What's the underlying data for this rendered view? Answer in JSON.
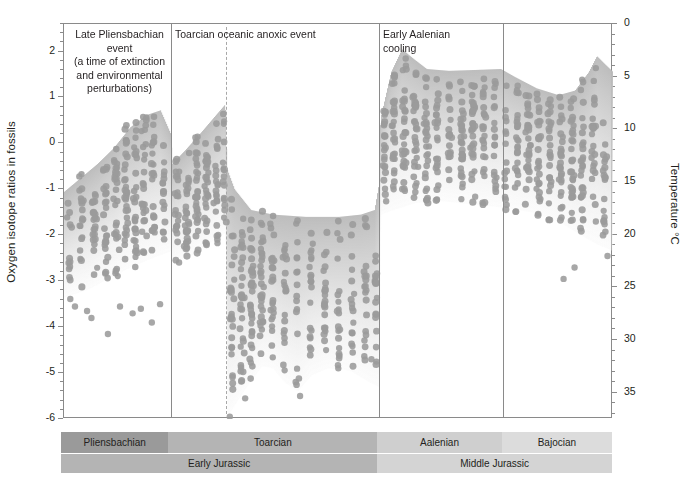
{
  "chart_data": {
    "type": "scatter",
    "title": "",
    "ylabel": "Oxygen isotope ratios in fossils",
    "ylabel_right": "Temperature °C",
    "xlabel": "",
    "ylim": [
      -6,
      2.6
    ],
    "yticks": [
      2,
      1,
      0,
      -1,
      -2,
      -3,
      -4,
      -5,
      -6
    ],
    "ytick_labels": [
      "2",
      "1",
      "0",
      "-1",
      "-2",
      "-3",
      "-4",
      "-5",
      "-6"
    ],
    "yminor_step": 0.2,
    "y2lim": [
      0,
      37.5
    ],
    "y2ticks": [
      0,
      5,
      10,
      15,
      20,
      25,
      30,
      35
    ],
    "y2tick_labels": [
      "0",
      "5",
      "10",
      "15",
      "20",
      "25",
      "30",
      "35"
    ],
    "y2minor_step": 1,
    "grid": false,
    "legend": "none",
    "point_color": "#a3a3a3",
    "envelope_color": "#c9c9c9",
    "xlim": [
      0,
      100
    ],
    "annotations": [
      {
        "id": "late-pliensbachian-event",
        "text": "Late Pliensbachian event (a time of extinction and environmental perturbations)",
        "lines": [
          "Late Pliensbachian event",
          "(a time of extinction",
          "and environmental",
          "perturbations)"
        ],
        "x_pct": 9.8,
        "align": "centered"
      },
      {
        "id": "toarcian-oceanic-anoxic-event",
        "text": "Toarcian oceanic anoxic event",
        "lines": [
          "Toarcian oceanic anoxic event"
        ],
        "x_pct": 20.0,
        "align": "left"
      },
      {
        "id": "early-aalenian-cooling",
        "text": "Early Aalenian cooling",
        "lines": [
          "Early Aalenian",
          "cooling"
        ],
        "x_pct": 58.0,
        "align": "left"
      }
    ],
    "dividers": [
      {
        "id": "divider-pliensbachian-toarcian",
        "x_pct": 19.5,
        "style": "solid"
      },
      {
        "id": "divider-oae-peak",
        "x_pct": 29.5,
        "style": "dashed"
      },
      {
        "id": "divider-toarcian-aalenian",
        "x_pct": 57.4,
        "style": "solid"
      },
      {
        "id": "divider-aalenian-bajocian",
        "x_pct": 80.0,
        "style": "solid"
      }
    ],
    "envelope_upper": [
      {
        "x": 0,
        "y": -1.05
      },
      {
        "x": 3,
        "y": -0.75
      },
      {
        "x": 6,
        "y": -0.45
      },
      {
        "x": 9,
        "y": -0.1
      },
      {
        "x": 12,
        "y": 0.35
      },
      {
        "x": 15,
        "y": 0.62
      },
      {
        "x": 17.5,
        "y": 0.72
      },
      {
        "x": 19.4,
        "y": 0.2
      },
      {
        "x": 19.6,
        "y": -0.45
      },
      {
        "x": 22,
        "y": -0.15
      },
      {
        "x": 25,
        "y": 0.25
      },
      {
        "x": 27.5,
        "y": 0.6
      },
      {
        "x": 29.3,
        "y": 0.85
      },
      {
        "x": 29.6,
        "y": -0.55
      },
      {
        "x": 31,
        "y": -1.0
      },
      {
        "x": 34,
        "y": -1.45
      },
      {
        "x": 38,
        "y": -1.55
      },
      {
        "x": 44,
        "y": -1.6
      },
      {
        "x": 50,
        "y": -1.6
      },
      {
        "x": 54,
        "y": -1.55
      },
      {
        "x": 56.5,
        "y": -1.45
      },
      {
        "x": 57.2,
        "y": -0.95
      },
      {
        "x": 57.6,
        "y": 0.55
      },
      {
        "x": 59.5,
        "y": 1.55
      },
      {
        "x": 61.5,
        "y": 2.05
      },
      {
        "x": 63.5,
        "y": 1.85
      },
      {
        "x": 66,
        "y": 1.62
      },
      {
        "x": 70,
        "y": 1.58
      },
      {
        "x": 75,
        "y": 1.6
      },
      {
        "x": 79.5,
        "y": 1.62
      },
      {
        "x": 82,
        "y": 1.45
      },
      {
        "x": 86,
        "y": 1.2
      },
      {
        "x": 90,
        "y": 1.05
      },
      {
        "x": 93,
        "y": 1.15
      },
      {
        "x": 95.5,
        "y": 1.55
      },
      {
        "x": 97,
        "y": 1.9
      },
      {
        "x": 98.5,
        "y": 1.72
      },
      {
        "x": 100,
        "y": 1.55
      }
    ],
    "envelope_lower": [
      {
        "x": 0,
        "y": -3.35
      },
      {
        "x": 4,
        "y": -3.2
      },
      {
        "x": 8,
        "y": -2.95
      },
      {
        "x": 12,
        "y": -2.7
      },
      {
        "x": 16,
        "y": -2.5
      },
      {
        "x": 19.4,
        "y": -2.35
      },
      {
        "x": 19.6,
        "y": -2.6
      },
      {
        "x": 23,
        "y": -2.45
      },
      {
        "x": 26,
        "y": -2.2
      },
      {
        "x": 29.3,
        "y": -1.95
      },
      {
        "x": 29.7,
        "y": -5.95
      },
      {
        "x": 31,
        "y": -5.7
      },
      {
        "x": 33.5,
        "y": -5.25
      },
      {
        "x": 36,
        "y": -4.85
      },
      {
        "x": 38,
        "y": -4.9
      },
      {
        "x": 40,
        "y": -5.2
      },
      {
        "x": 42.5,
        "y": -5.4
      },
      {
        "x": 45,
        "y": -5.05
      },
      {
        "x": 48,
        "y": -4.9
      },
      {
        "x": 52,
        "y": -4.95
      },
      {
        "x": 55.5,
        "y": -5.2
      },
      {
        "x": 57.2,
        "y": -5.3
      },
      {
        "x": 57.6,
        "y": -1.55
      },
      {
        "x": 60,
        "y": -1.45
      },
      {
        "x": 64,
        "y": -1.3
      },
      {
        "x": 68,
        "y": -1.25
      },
      {
        "x": 72,
        "y": -1.3
      },
      {
        "x": 76,
        "y": -1.35
      },
      {
        "x": 80,
        "y": -1.4
      },
      {
        "x": 85,
        "y": -1.5
      },
      {
        "x": 90,
        "y": -1.7
      },
      {
        "x": 94,
        "y": -2.0
      },
      {
        "x": 97,
        "y": -2.2
      },
      {
        "x": 100,
        "y": -2.35
      }
    ],
    "clusters": [
      {
        "x": 1.0,
        "n": 9,
        "ymin": -3.4,
        "ymax": -0.6,
        "w": 1.3
      },
      {
        "x": 3.2,
        "n": 14,
        "ymin": -3.3,
        "ymax": -0.55,
        "w": 1.6
      },
      {
        "x": 5.5,
        "n": 16,
        "ymin": -3.2,
        "ymax": -0.7,
        "w": 1.6
      },
      {
        "x": 7.6,
        "n": 18,
        "ymin": -3.1,
        "ymax": -0.5,
        "w": 1.5
      },
      {
        "x": 9.5,
        "n": 20,
        "ymin": -2.95,
        "ymax": 0.15,
        "w": 1.7
      },
      {
        "x": 11.3,
        "n": 22,
        "ymin": -2.85,
        "ymax": 0.45,
        "w": 1.5
      },
      {
        "x": 13.0,
        "n": 20,
        "ymin": -2.7,
        "ymax": 0.55,
        "w": 1.4
      },
      {
        "x": 14.6,
        "n": 18,
        "ymin": -2.6,
        "ymax": 0.68,
        "w": 1.3
      },
      {
        "x": 16.3,
        "n": 16,
        "ymin": -2.55,
        "ymax": 0.7,
        "w": 1.3
      },
      {
        "x": 18.2,
        "n": 12,
        "ymin": -2.45,
        "ymax": 0.1,
        "w": 1.2
      },
      {
        "x": 20.6,
        "n": 16,
        "ymin": -2.6,
        "ymax": -0.3,
        "w": 1.3
      },
      {
        "x": 22.4,
        "n": 20,
        "ymin": -2.55,
        "ymax": -0.2,
        "w": 1.4
      },
      {
        "x": 24.2,
        "n": 22,
        "ymin": -2.45,
        "ymax": 0.15,
        "w": 1.4
      },
      {
        "x": 26.0,
        "n": 20,
        "ymin": -2.35,
        "ymax": 0.35,
        "w": 1.3
      },
      {
        "x": 27.8,
        "n": 16,
        "ymin": -2.25,
        "ymax": 0.6,
        "w": 1.3
      },
      {
        "x": 29.2,
        "n": 12,
        "ymin": -2.1,
        "ymax": 0.85,
        "w": 1.0
      },
      {
        "x": 30.6,
        "n": 18,
        "ymin": -5.6,
        "ymax": -1.05,
        "w": 1.2
      },
      {
        "x": 32.4,
        "n": 22,
        "ymin": -5.4,
        "ymax": -1.2,
        "w": 1.3
      },
      {
        "x": 34.2,
        "n": 24,
        "ymin": -5.2,
        "ymax": -1.4,
        "w": 1.3
      },
      {
        "x": 36.0,
        "n": 22,
        "ymin": -4.85,
        "ymax": -1.45,
        "w": 1.3
      },
      {
        "x": 38.0,
        "n": 18,
        "ymin": -4.9,
        "ymax": -1.5,
        "w": 1.2
      },
      {
        "x": 40.2,
        "n": 14,
        "ymin": -5.1,
        "ymax": -1.55,
        "w": 1.1
      },
      {
        "x": 42.5,
        "n": 12,
        "ymin": -5.3,
        "ymax": -1.6,
        "w": 1.1
      },
      {
        "x": 45.0,
        "n": 14,
        "ymin": -5.0,
        "ymax": -1.6,
        "w": 1.2
      },
      {
        "x": 47.5,
        "n": 16,
        "ymin": -4.85,
        "ymax": -1.6,
        "w": 1.2
      },
      {
        "x": 50.0,
        "n": 14,
        "ymin": -4.9,
        "ymax": -1.6,
        "w": 1.2
      },
      {
        "x": 52.5,
        "n": 12,
        "ymin": -4.95,
        "ymax": -1.6,
        "w": 1.1
      },
      {
        "x": 55.0,
        "n": 14,
        "ymin": -5.15,
        "ymax": -1.55,
        "w": 1.2
      },
      {
        "x": 56.8,
        "n": 12,
        "ymin": -5.3,
        "ymax": -1.5,
        "w": 1.0
      },
      {
        "x": 58.4,
        "n": 16,
        "ymin": -1.5,
        "ymax": 0.95,
        "w": 1.2
      },
      {
        "x": 60.0,
        "n": 20,
        "ymin": -1.45,
        "ymax": 1.5,
        "w": 1.3
      },
      {
        "x": 62.0,
        "n": 22,
        "ymin": -1.4,
        "ymax": 1.85,
        "w": 1.4
      },
      {
        "x": 64.0,
        "n": 22,
        "ymin": -1.35,
        "ymax": 1.55,
        "w": 1.4
      },
      {
        "x": 66.0,
        "n": 20,
        "ymin": -1.3,
        "ymax": 1.45,
        "w": 1.3
      },
      {
        "x": 68.0,
        "n": 16,
        "ymin": -1.3,
        "ymax": 1.4,
        "w": 1.2
      },
      {
        "x": 70.2,
        "n": 14,
        "ymin": -1.3,
        "ymax": 1.45,
        "w": 1.2
      },
      {
        "x": 72.5,
        "n": 22,
        "ymin": -1.35,
        "ymax": 1.5,
        "w": 1.4
      },
      {
        "x": 74.5,
        "n": 24,
        "ymin": -1.35,
        "ymax": 1.55,
        "w": 1.4
      },
      {
        "x": 76.5,
        "n": 18,
        "ymin": -1.4,
        "ymax": 1.45,
        "w": 1.3
      },
      {
        "x": 78.5,
        "n": 14,
        "ymin": -1.4,
        "ymax": 1.4,
        "w": 1.2
      },
      {
        "x": 80.5,
        "n": 12,
        "ymin": -1.45,
        "ymax": 1.35,
        "w": 1.1
      },
      {
        "x": 82.5,
        "n": 18,
        "ymin": -1.5,
        "ymax": 1.3,
        "w": 1.3
      },
      {
        "x": 84.5,
        "n": 22,
        "ymin": -1.55,
        "ymax": 1.2,
        "w": 1.4
      },
      {
        "x": 86.5,
        "n": 20,
        "ymin": -1.6,
        "ymax": 1.1,
        "w": 1.3
      },
      {
        "x": 88.5,
        "n": 18,
        "ymin": -1.7,
        "ymax": 1.05,
        "w": 1.3
      },
      {
        "x": 90.5,
        "n": 20,
        "ymin": -1.8,
        "ymax": 1.05,
        "w": 1.4
      },
      {
        "x": 92.5,
        "n": 22,
        "ymin": -1.95,
        "ymax": 1.15,
        "w": 1.4
      },
      {
        "x": 94.5,
        "n": 20,
        "ymin": -2.1,
        "ymax": 1.45,
        "w": 1.4
      },
      {
        "x": 96.5,
        "n": 18,
        "ymin": -2.2,
        "ymax": 1.85,
        "w": 1.3
      },
      {
        "x": 98.5,
        "n": 14,
        "ymin": -2.3,
        "ymax": 1.65,
        "w": 1.2
      }
    ],
    "outliers": [
      {
        "x": 2.0,
        "y": -3.55
      },
      {
        "x": 4.2,
        "y": -3.65
      },
      {
        "x": 5.0,
        "y": -3.8
      },
      {
        "x": 8.0,
        "y": -4.15
      },
      {
        "x": 10.2,
        "y": -3.55
      },
      {
        "x": 12.5,
        "y": -3.7
      },
      {
        "x": 14.0,
        "y": -3.6
      },
      {
        "x": 16.0,
        "y": -3.9
      },
      {
        "x": 17.5,
        "y": -3.5
      },
      {
        "x": 30.2,
        "y": -5.95
      },
      {
        "x": 33.0,
        "y": -5.55
      },
      {
        "x": 43.0,
        "y": -5.5
      },
      {
        "x": 56.0,
        "y": -4.7
      },
      {
        "x": 56.9,
        "y": -4.75
      },
      {
        "x": 91.0,
        "y": -2.95
      },
      {
        "x": 93.0,
        "y": -2.7
      },
      {
        "x": 99.0,
        "y": -2.45
      }
    ]
  },
  "timeline": {
    "stages": [
      {
        "label": "Pliensbachian",
        "width_pct": 19.5,
        "color": "#9a9a9a"
      },
      {
        "label": "Toarcian",
        "width_pct": 37.9,
        "color": "#b4b4b4"
      },
      {
        "label": "Aalenian",
        "width_pct": 22.6,
        "color": "#cfcfcf"
      },
      {
        "label": "Bajocian",
        "width_pct": 20.0,
        "color": "#dcdcdc"
      }
    ],
    "epochs": [
      {
        "label": "Early Jurassic",
        "width_pct": 57.4,
        "color": "#b4b4b4"
      },
      {
        "label": "Middle Jurassic",
        "width_pct": 42.6,
        "color": "#d4d4d4"
      }
    ]
  }
}
